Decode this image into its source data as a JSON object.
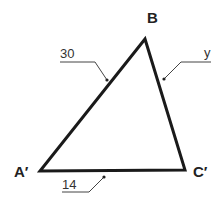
{
  "diagram": {
    "type": "triangle",
    "colors": {
      "stroke": "#1a1a1a",
      "leader": "#444444",
      "background": "#ffffff"
    },
    "vertices": {
      "B": {
        "label": "B",
        "x": 145,
        "y": 39
      },
      "A": {
        "label": "A′",
        "x": 40,
        "y": 171
      },
      "C": {
        "label": "C′",
        "x": 185,
        "y": 170
      }
    },
    "sides": {
      "AB": {
        "label": "30"
      },
      "BC": {
        "label": "y"
      },
      "AC": {
        "label": "14"
      }
    }
  }
}
